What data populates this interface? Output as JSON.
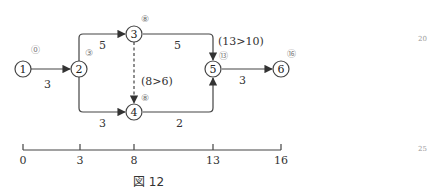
{
  "figure": {
    "caption": "図 12",
    "margin_numbers": [
      "20",
      "25"
    ]
  },
  "nodes": [
    {
      "id": "1",
      "label": "1",
      "earliest": "⓪",
      "x": 23,
      "y": 69
    },
    {
      "id": "2",
      "label": "2",
      "earliest": "③",
      "x": 79,
      "y": 69
    },
    {
      "id": "3",
      "label": "3",
      "earliest": "⑧",
      "x": 134,
      "y": 34
    },
    {
      "id": "4",
      "label": "4",
      "earliest": "⑧",
      "x": 134,
      "y": 112
    },
    {
      "id": "5",
      "label": "5",
      "earliest": "⑬",
      "x": 213,
      "y": 69
    },
    {
      "id": "6",
      "label": "6",
      "earliest": "⑯",
      "x": 281,
      "y": 69
    }
  ],
  "edges": [
    {
      "from": "1",
      "to": "2",
      "duration": "3"
    },
    {
      "from": "2",
      "to": "3",
      "duration": "5"
    },
    {
      "from": "2",
      "to": "4",
      "duration": "3"
    },
    {
      "from": "3",
      "to": "4",
      "duration": "",
      "dummy": true
    },
    {
      "from": "3",
      "to": "5",
      "duration": "5"
    },
    {
      "from": "4",
      "to": "5",
      "duration": "2"
    },
    {
      "from": "5",
      "to": "6",
      "duration": "3"
    }
  ],
  "annotations": {
    "node5_compare": "(13>10)",
    "node4_compare": "(8>6)"
  },
  "timeline": {
    "ticks": [
      "0",
      "3",
      "8",
      "13",
      "16"
    ]
  }
}
